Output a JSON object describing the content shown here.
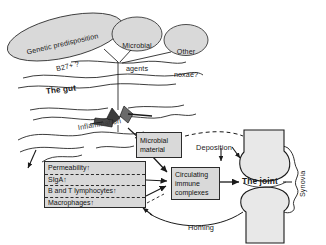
{
  "figure": {
    "background": "#ffffff",
    "ink": "#1a1a1a",
    "box_fill": "#d9d9d9",
    "box_stroke": "#2b2b2b",
    "ellipse_fill": "#d9d9d9"
  },
  "ellipses": [
    {
      "id": "genetic",
      "line1": "Genetic predisposition",
      "line2": "B27+ ?"
    },
    {
      "id": "microbial",
      "line1": "Microbial",
      "line2": "agents"
    },
    {
      "id": "noxae",
      "line1": "Other",
      "line2": "noxae?"
    }
  ],
  "gut": {
    "label": "The gut",
    "inflammation_label": "Inflammation"
  },
  "boxes": {
    "microbial_material": {
      "line1": "Microbial",
      "line2": "material"
    },
    "circulating": {
      "line1": "Circulating",
      "line2": "immune",
      "line3": "complexes"
    },
    "mucosa_panel": {
      "rows": [
        {
          "text": "Permeability",
          "arrow": "↑"
        },
        {
          "text": "SIgA",
          "arrow": "↑"
        },
        {
          "text": "B and T lymphocytes",
          "arrow": "↑"
        },
        {
          "text": "Macrophages",
          "arrow": "↑"
        }
      ]
    }
  },
  "joint": {
    "label": "The joint",
    "synovia_label": "Synovia"
  },
  "arrow_labels": {
    "deposition": "Deposition",
    "homing": "Homing"
  }
}
